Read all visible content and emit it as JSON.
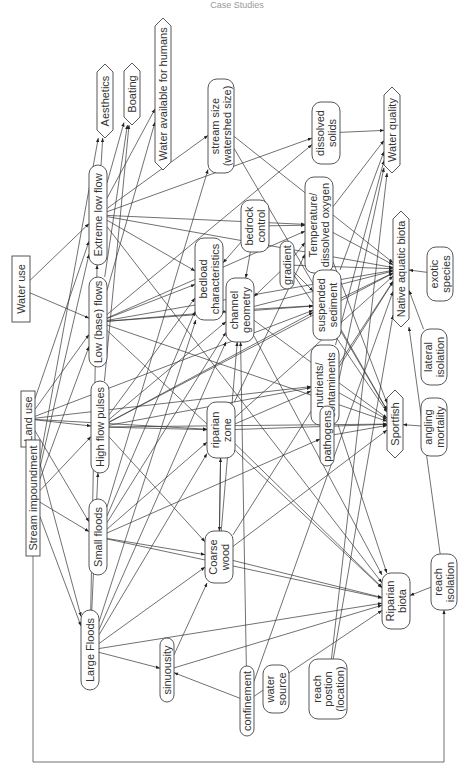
{
  "header": {
    "title": "Case Studies"
  },
  "colors": {
    "line": "#333333",
    "box_stroke": "#444444",
    "text": "#333333",
    "background": "#ffffff"
  },
  "diagram": {
    "orientation": "rotated-90-ccw",
    "nodes": [
      {
        "id": "water_use",
        "lines": [
          "Water use"
        ],
        "shape": "rect",
        "cx": 21,
        "cy": 289,
        "w": 18,
        "h": 66
      },
      {
        "id": "land_use",
        "lines": [
          "Land use"
        ],
        "shape": "rect",
        "cx": 28,
        "cy": 419,
        "w": 14,
        "h": 56
      },
      {
        "id": "stream_impoundment",
        "lines": [
          "Stream impoundment"
        ],
        "shape": "rect",
        "cx": 33,
        "cy": 498,
        "w": 14,
        "h": 116
      },
      {
        "id": "extreme_low_flow",
        "lines": [
          "Extreme low flow"
        ],
        "shape": "round",
        "cx": 98,
        "cy": 215,
        "w": 18,
        "h": 100
      },
      {
        "id": "low_base_flows",
        "lines": [
          "Low (base) flows"
        ],
        "shape": "round",
        "cx": 98,
        "cy": 322,
        "w": 18,
        "h": 90
      },
      {
        "id": "high_flow_pulses",
        "lines": [
          "High flow pulses"
        ],
        "shape": "round",
        "cx": 100,
        "cy": 427,
        "w": 18,
        "h": 92
      },
      {
        "id": "small_floods",
        "lines": [
          "Small floods"
        ],
        "shape": "round",
        "cx": 98,
        "cy": 537,
        "w": 18,
        "h": 76
      },
      {
        "id": "large_floods",
        "lines": [
          "Large Floods"
        ],
        "shape": "round",
        "cx": 90,
        "cy": 650,
        "w": 18,
        "h": 80
      },
      {
        "id": "aesthetics",
        "lines": [
          "Aesthetics"
        ],
        "shape": "hex",
        "cx": 105,
        "cy": 101,
        "w": 16,
        "h": 74
      },
      {
        "id": "boating",
        "lines": [
          "Boating"
        ],
        "shape": "hex",
        "cx": 132,
        "cy": 94,
        "w": 16,
        "h": 62
      },
      {
        "id": "water_available",
        "lines": [
          "Water available for humans"
        ],
        "shape": "hex",
        "cx": 163,
        "cy": 94,
        "w": 16,
        "h": 152
      },
      {
        "id": "stream_size",
        "lines": [
          "stream size",
          "(watershed size)"
        ],
        "shape": "round",
        "cx": 221,
        "cy": 126,
        "w": 26,
        "h": 94
      },
      {
        "id": "dissolved_solids",
        "lines": [
          "dissolved",
          "solids"
        ],
        "shape": "round",
        "cx": 326,
        "cy": 133,
        "w": 28,
        "h": 62
      },
      {
        "id": "water_quality",
        "lines": [
          "Water quality"
        ],
        "shape": "hex",
        "cx": 392,
        "cy": 130,
        "w": 16,
        "h": 86
      },
      {
        "id": "bedload",
        "lines": [
          "bedload",
          "characteristics"
        ],
        "shape": "round",
        "cx": 209,
        "cy": 279,
        "w": 28,
        "h": 82
      },
      {
        "id": "bedrock_control",
        "lines": [
          "bedrock",
          "control"
        ],
        "shape": "round",
        "cx": 255,
        "cy": 226,
        "w": 28,
        "h": 52
      },
      {
        "id": "temperature_do",
        "lines": [
          "Temperature/",
          "dissolved oxygen"
        ],
        "shape": "round",
        "cx": 319,
        "cy": 225,
        "w": 28,
        "h": 96
      },
      {
        "id": "gradient",
        "lines": [
          "gradient"
        ],
        "shape": "round",
        "cx": 287,
        "cy": 265,
        "w": 14,
        "h": 48
      },
      {
        "id": "native_aquatic_biota",
        "lines": [
          "Native aquatic biota"
        ],
        "shape": "hex",
        "cx": 401,
        "cy": 269,
        "w": 16,
        "h": 116
      },
      {
        "id": "exotic_species",
        "lines": [
          "exotic",
          "species"
        ],
        "shape": "round",
        "cx": 440,
        "cy": 274,
        "w": 26,
        "h": 54
      },
      {
        "id": "channel_geometry",
        "lines": [
          "channel",
          "geometry"
        ],
        "shape": "round",
        "cx": 240,
        "cy": 310,
        "w": 28,
        "h": 64
      },
      {
        "id": "suspended_sediment",
        "lines": [
          "suspended",
          "sediment"
        ],
        "shape": "round",
        "cx": 327,
        "cy": 305,
        "w": 28,
        "h": 70
      },
      {
        "id": "lateral_isolation",
        "lines": [
          "lateral",
          "isolation"
        ],
        "shape": "round",
        "cx": 434,
        "cy": 357,
        "w": 26,
        "h": 56
      },
      {
        "id": "nutrients_contaminents",
        "lines": [
          "nutrients/",
          "contaminents"
        ],
        "shape": "round",
        "cx": 325,
        "cy": 385,
        "w": 28,
        "h": 80
      },
      {
        "id": "riparian_zone",
        "lines": [
          "riparian",
          "zone"
        ],
        "shape": "round",
        "cx": 221,
        "cy": 430,
        "w": 28,
        "h": 56
      },
      {
        "id": "pathogens",
        "lines": [
          "pathogens"
        ],
        "shape": "round",
        "cx": 327,
        "cy": 436,
        "w": 14,
        "h": 60
      },
      {
        "id": "sportfish",
        "lines": [
          "Sportfish"
        ],
        "shape": "hex",
        "cx": 395,
        "cy": 424,
        "w": 16,
        "h": 68
      },
      {
        "id": "angling_mortality",
        "lines": [
          "angling",
          "mortality"
        ],
        "shape": "round",
        "cx": 434,
        "cy": 427,
        "w": 26,
        "h": 58
      },
      {
        "id": "coarse_wood",
        "lines": [
          "Coarse",
          "wood"
        ],
        "shape": "round",
        "cx": 219,
        "cy": 557,
        "w": 28,
        "h": 52
      },
      {
        "id": "sinuousity",
        "lines": [
          "sinuousity"
        ],
        "shape": "round",
        "cx": 167,
        "cy": 670,
        "w": 14,
        "h": 64
      },
      {
        "id": "confinement",
        "lines": [
          "confinement"
        ],
        "shape": "round",
        "cx": 247,
        "cy": 701,
        "w": 14,
        "h": 70
      },
      {
        "id": "water_source",
        "lines": [
          "water",
          "source"
        ],
        "shape": "round",
        "cx": 276,
        "cy": 689,
        "w": 26,
        "h": 48
      },
      {
        "id": "reach_position",
        "lines": [
          "reach",
          "postion",
          "(location)"
        ],
        "shape": "round",
        "cx": 328,
        "cy": 689,
        "w": 38,
        "h": 60
      },
      {
        "id": "riparian_biota",
        "lines": [
          "Riparian",
          "biota"
        ],
        "shape": "round",
        "cx": 396,
        "cy": 601,
        "w": 28,
        "h": 56
      },
      {
        "id": "reach_isolation",
        "lines": [
          "reach",
          "isolation"
        ],
        "shape": "round",
        "cx": 444,
        "cy": 582,
        "w": 26,
        "h": 56
      }
    ],
    "edges": [
      [
        "water_use",
        "extreme_low_flow"
      ],
      [
        "water_use",
        "low_base_flows"
      ],
      [
        "land_use",
        "extreme_low_flow"
      ],
      [
        "land_use",
        "low_base_flows"
      ],
      [
        "land_use",
        "high_flow_pulses"
      ],
      [
        "land_use",
        "small_floods"
      ],
      [
        "land_use",
        "large_floods"
      ],
      [
        "land_use",
        "riparian_zone"
      ],
      [
        "land_use",
        "nutrients_contaminents"
      ],
      [
        "land_use",
        "suspended_sediment"
      ],
      [
        "stream_impoundment",
        "extreme_low_flow"
      ],
      [
        "stream_impoundment",
        "low_base_flows"
      ],
      [
        "stream_impoundment",
        "high_flow_pulses"
      ],
      [
        "stream_impoundment",
        "small_floods"
      ],
      [
        "stream_impoundment",
        "large_floods"
      ],
      [
        "stream_impoundment",
        "aesthetics"
      ],
      [
        "extreme_low_flow",
        "aesthetics"
      ],
      [
        "extreme_low_flow",
        "boating"
      ],
      [
        "extreme_low_flow",
        "water_available"
      ],
      [
        "extreme_low_flow",
        "stream_size"
      ],
      [
        "extreme_low_flow",
        "dissolved_solids"
      ],
      [
        "extreme_low_flow",
        "temperature_do"
      ],
      [
        "extreme_low_flow",
        "native_aquatic_biota"
      ],
      [
        "extreme_low_flow",
        "riparian_biota"
      ],
      [
        "extreme_low_flow",
        "bedload"
      ],
      [
        "low_base_flows",
        "boating"
      ],
      [
        "low_base_flows",
        "water_available"
      ],
      [
        "low_base_flows",
        "bedload"
      ],
      [
        "low_base_flows",
        "channel_geometry"
      ],
      [
        "low_base_flows",
        "temperature_do"
      ],
      [
        "low_base_flows",
        "suspended_sediment"
      ],
      [
        "low_base_flows",
        "native_aquatic_biota"
      ],
      [
        "low_base_flows",
        "sportfish"
      ],
      [
        "low_base_flows",
        "riparian_biota"
      ],
      [
        "low_base_flows",
        "dissolved_solids"
      ],
      [
        "high_flow_pulses",
        "boating"
      ],
      [
        "high_flow_pulses",
        "bedload"
      ],
      [
        "high_flow_pulses",
        "channel_geometry"
      ],
      [
        "high_flow_pulses",
        "riparian_zone"
      ],
      [
        "high_flow_pulses",
        "suspended_sediment"
      ],
      [
        "high_flow_pulses",
        "nutrients_contaminents"
      ],
      [
        "high_flow_pulses",
        "sportfish"
      ],
      [
        "high_flow_pulses",
        "coarse_wood"
      ],
      [
        "high_flow_pulses",
        "native_aquatic_biota"
      ],
      [
        "small_floods",
        "bedload"
      ],
      [
        "small_floods",
        "channel_geometry"
      ],
      [
        "small_floods",
        "riparian_zone"
      ],
      [
        "small_floods",
        "coarse_wood"
      ],
      [
        "small_floods",
        "riparian_biota"
      ],
      [
        "small_floods",
        "pathogens"
      ],
      [
        "small_floods",
        "stream_size"
      ],
      [
        "large_floods",
        "bedload"
      ],
      [
        "large_floods",
        "channel_geometry"
      ],
      [
        "large_floods",
        "riparian_zone"
      ],
      [
        "large_floods",
        "coarse_wood"
      ],
      [
        "large_floods",
        "sinuousity"
      ],
      [
        "large_floods",
        "riparian_biota"
      ],
      [
        "large_floods",
        "high_flow_pulses"
      ],
      [
        "large_floods",
        "extreme_low_flow"
      ],
      [
        "stream_size",
        "native_aquatic_biota"
      ],
      [
        "stream_size",
        "sportfish"
      ],
      [
        "dissolved_solids",
        "water_quality"
      ],
      [
        "bedrock_control",
        "bedload"
      ],
      [
        "bedrock_control",
        "channel_geometry"
      ],
      [
        "bedrock_control",
        "temperature_do"
      ],
      [
        "gradient",
        "channel_geometry"
      ],
      [
        "gradient",
        "temperature_do"
      ],
      [
        "gradient",
        "suspended_sediment"
      ],
      [
        "gradient",
        "sportfish"
      ],
      [
        "gradient",
        "native_aquatic_biota"
      ],
      [
        "temperature_do",
        "native_aquatic_biota"
      ],
      [
        "temperature_do",
        "water_quality"
      ],
      [
        "temperature_do",
        "sportfish"
      ],
      [
        "suspended_sediment",
        "native_aquatic_biota"
      ],
      [
        "suspended_sediment",
        "water_quality"
      ],
      [
        "suspended_sediment",
        "sportfish"
      ],
      [
        "nutrients_contaminents",
        "native_aquatic_biota"
      ],
      [
        "nutrients_contaminents",
        "water_quality"
      ],
      [
        "nutrients_contaminents",
        "sportfish"
      ],
      [
        "nutrients_contaminents",
        "riparian_biota"
      ],
      [
        "channel_geometry",
        "native_aquatic_biota"
      ],
      [
        "channel_geometry",
        "sportfish"
      ],
      [
        "channel_geometry",
        "riparian_biota"
      ],
      [
        "channel_geometry",
        "suspended_sediment"
      ],
      [
        "riparian_zone",
        "coarse_wood"
      ],
      [
        "riparian_zone",
        "temperature_do"
      ],
      [
        "riparian_zone",
        "native_aquatic_biota"
      ],
      [
        "riparian_zone",
        "sportfish"
      ],
      [
        "riparian_zone",
        "riparian_biota"
      ],
      [
        "riparian_zone",
        "nutrients_contaminents"
      ],
      [
        "coarse_wood",
        "riparian_zone"
      ],
      [
        "coarse_wood",
        "native_aquatic_biota"
      ],
      [
        "coarse_wood",
        "sportfish"
      ],
      [
        "coarse_wood",
        "riparian_biota"
      ],
      [
        "coarse_wood",
        "channel_geometry"
      ],
      [
        "pathogens",
        "sportfish"
      ],
      [
        "pathogens",
        "water_quality"
      ],
      [
        "exotic_species",
        "native_aquatic_biota"
      ],
      [
        "lateral_isolation",
        "native_aquatic_biota"
      ],
      [
        "angling_mortality",
        "sportfish"
      ],
      [
        "reach_isolation",
        "riparian_biota"
      ],
      [
        "reach_isolation",
        "native_aquatic_biota"
      ],
      [
        "confinement",
        "sinuousity"
      ],
      [
        "confinement",
        "riparian_biota"
      ],
      [
        "confinement",
        "channel_geometry"
      ],
      [
        "confinement",
        "native_aquatic_biota"
      ],
      [
        "reach_position",
        "native_aquatic_biota"
      ],
      [
        "reach_position",
        "water_quality"
      ],
      [
        "sinuousity",
        "coarse_wood"
      ],
      [
        "sinuousity",
        "riparian_biota"
      ]
    ],
    "bracket": {
      "from": "stream_impoundment",
      "to": "reach_isolation",
      "x_left": 33,
      "y_bottom": 762,
      "x_right": 444
    }
  }
}
